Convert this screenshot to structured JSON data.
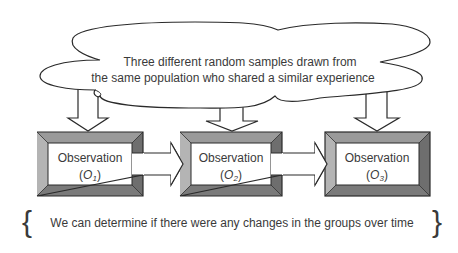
{
  "cloud": {
    "line1": "Three different random samples drawn from",
    "line2": "the same population who shared a similar experience"
  },
  "observations": [
    {
      "label": "Observation",
      "symbol": "O",
      "subscript": "1"
    },
    {
      "label": "Observation",
      "symbol": "O",
      "subscript": "2"
    },
    {
      "label": "Observation",
      "symbol": "O",
      "subscript": "3"
    }
  ],
  "conclusion": {
    "text": "We can determine if there were any changes in the groups over time",
    "left_brace": "{",
    "right_brace": "}"
  },
  "colors": {
    "stroke": "#2a2a2a",
    "bevel_light": "#b4b4b4",
    "bevel_mid": "#8c8c8c",
    "bevel_dark": "#6e6e6e",
    "text": "#3a3a3a"
  }
}
